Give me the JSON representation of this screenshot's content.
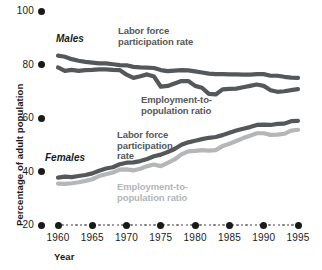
{
  "chart_data": {
    "type": "line",
    "title": "",
    "xlabel": "Year",
    "ylabel": "Percentage of adult population",
    "xlim": [
      1960,
      1995
    ],
    "ylim": [
      20,
      100
    ],
    "yticks": [
      20,
      40,
      60,
      80,
      100
    ],
    "xticks": [
      1960,
      1965,
      1970,
      1975,
      1980,
      1985,
      1990,
      1995
    ],
    "grid": false,
    "legend_position": "inline-annotations",
    "x": [
      1960,
      1961,
      1962,
      1963,
      1964,
      1965,
      1966,
      1967,
      1968,
      1969,
      1970,
      1971,
      1972,
      1973,
      1974,
      1975,
      1976,
      1977,
      1978,
      1979,
      1980,
      1981,
      1982,
      1983,
      1984,
      1985,
      1986,
      1987,
      1988,
      1989,
      1990,
      1991,
      1992,
      1993,
      1994,
      1995
    ],
    "series": [
      {
        "name": "Males, labor force participation rate",
        "group": "Males",
        "color": "#55585a",
        "values": [
          83.3,
          82.9,
          82.0,
          81.4,
          81.0,
          80.7,
          80.4,
          80.4,
          80.1,
          79.8,
          79.7,
          79.1,
          78.9,
          78.8,
          78.7,
          77.9,
          77.5,
          77.7,
          77.9,
          77.8,
          77.4,
          77.0,
          76.6,
          76.4,
          76.4,
          76.3,
          76.3,
          76.2,
          76.2,
          76.4,
          76.4,
          75.8,
          75.8,
          75.4,
          75.1,
          75.0
        ]
      },
      {
        "name": "Males, employment-to-population ratio",
        "group": "Males",
        "color": "#55585a",
        "values": [
          78.9,
          77.6,
          78.0,
          77.6,
          77.9,
          78.0,
          78.2,
          78.2,
          78.0,
          77.9,
          76.2,
          75.0,
          75.6,
          76.3,
          75.5,
          71.7,
          72.0,
          72.9,
          73.8,
          73.8,
          72.0,
          71.3,
          69.0,
          68.8,
          70.7,
          70.9,
          71.0,
          71.5,
          72.0,
          72.5,
          72.0,
          70.4,
          69.8,
          70.0,
          70.4,
          70.8
        ]
      },
      {
        "name": "Females, labor force participation rate",
        "group": "Females",
        "color": "#55585a",
        "values": [
          37.7,
          38.1,
          37.9,
          38.3,
          38.7,
          39.3,
          40.3,
          41.1,
          41.6,
          42.7,
          43.3,
          43.4,
          43.9,
          44.7,
          45.7,
          46.3,
          47.3,
          48.4,
          50.0,
          50.9,
          51.5,
          52.1,
          52.6,
          52.9,
          53.6,
          54.5,
          55.3,
          56.0,
          56.6,
          57.4,
          57.5,
          57.4,
          57.8,
          57.9,
          58.8,
          58.9
        ]
      },
      {
        "name": "Females, employment-to-population ratio",
        "group": "Females",
        "color": "#b4b6b7",
        "values": [
          35.5,
          35.4,
          35.6,
          36.0,
          36.5,
          37.1,
          38.3,
          39.0,
          39.6,
          40.7,
          40.8,
          40.4,
          41.0,
          42.0,
          42.6,
          42.0,
          43.2,
          44.5,
          46.4,
          47.5,
          47.7,
          48.0,
          47.8,
          48.0,
          49.5,
          50.4,
          51.4,
          52.5,
          53.4,
          54.3,
          54.3,
          53.7,
          53.8,
          54.1,
          55.3,
          55.6
        ]
      }
    ],
    "annotations": [
      {
        "id": "males-group",
        "text": "Males",
        "style": "bold-italic"
      },
      {
        "id": "females-group",
        "text": "Females",
        "style": "bold-italic"
      },
      {
        "id": "males-lfp-label",
        "line1": "Labor force",
        "line2": "participation rate",
        "color": "#55585a"
      },
      {
        "id": "males-epr-label",
        "line1": "Employment-to-",
        "line2": "population ratio",
        "color": "#55585a"
      },
      {
        "id": "females-lfp-label",
        "line1": "Labor force",
        "line2": "participation",
        "line3": "rate",
        "color": "#55585a"
      },
      {
        "id": "females-epr-label",
        "line1": "Employment-to-",
        "line2": "population ratio",
        "color": "#b4b6b7"
      }
    ]
  },
  "axes": {
    "y_tick_labels": [
      "100",
      "80",
      "60",
      "40",
      "20"
    ],
    "x_tick_labels": [
      "1960",
      "1965",
      "1970",
      "1975",
      "1980",
      "1985",
      "1990",
      "1995"
    ],
    "y_axis_title": "Percentage of adult population",
    "x_axis_title": "Year"
  },
  "annotations_text": {
    "males": "Males",
    "females": "Females",
    "males_lfp_l1": "Labor force",
    "males_lfp_l2": "participation rate",
    "males_epr_l1": "Employment-to-",
    "males_epr_l2": "population ratio",
    "females_lfp_l1": "Labor force",
    "females_lfp_l2": "participation",
    "females_lfp_l3": "rate",
    "females_epr_l1": "Employment-to-",
    "females_epr_l2": "population ratio"
  },
  "colors": {
    "dark_series": "#55585a",
    "light_series": "#b4b6b7",
    "text": "#1a1a1a",
    "background": "#ffffff"
  }
}
